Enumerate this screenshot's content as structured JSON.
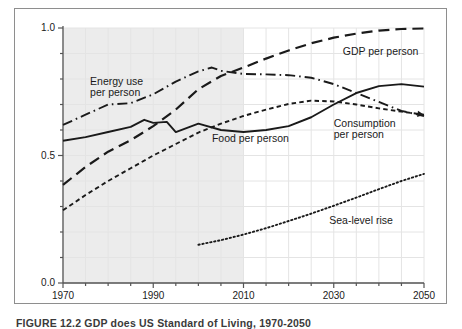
{
  "figure": {
    "caption": "FIGURE 12.2   GDP does US Standard of Living, 1970-2050",
    "frame_color": "#8e8e8e",
    "background": "#ffffff",
    "shade_color": "#ececec",
    "grid_color": "#e4e4e4",
    "axis_color": "#555555",
    "line_color": "#1a1a1a"
  },
  "chart_data": {
    "type": "line",
    "title": "",
    "xlabel": "",
    "ylabel": "",
    "xlim": [
      1970,
      2050
    ],
    "ylim": [
      0.0,
      1.0
    ],
    "grid": true,
    "legend": "annotated-inline",
    "x_ticks": [
      1970,
      1990,
      2010,
      2030,
      2050
    ],
    "x_tick_labels": [
      "1970",
      "1990",
      "2010",
      "2030",
      "2050"
    ],
    "x_minor_step": 5,
    "y_ticks": [
      0.0,
      0.5,
      1.0
    ],
    "y_tick_labels": [
      "0.0",
      "0.5",
      "1.0"
    ],
    "y_minor_step": 0.1,
    "shaded_region": {
      "from": 1970,
      "to": 2010,
      "note": "historical period shading"
    },
    "series": [
      {
        "name": "GDP per person",
        "style": "long-dash",
        "label_x": 2032,
        "label_y": 0.905,
        "x": [
          1970,
          1975,
          1980,
          1985,
          1990,
          1995,
          2000,
          2005,
          2010,
          2015,
          2020,
          2025,
          2030,
          2035,
          2040,
          2045,
          2050
        ],
        "y": [
          0.385,
          0.455,
          0.515,
          0.56,
          0.615,
          0.68,
          0.76,
          0.812,
          0.845,
          0.88,
          0.912,
          0.94,
          0.962,
          0.978,
          0.99,
          0.996,
          0.998
        ]
      },
      {
        "name": "Energy use per person",
        "style": "dash-dot",
        "label_x": 1976,
        "label_y": 0.79,
        "label_lines": [
          "Energy use",
          "per person"
        ],
        "x": [
          1970,
          1975,
          1980,
          1985,
          1990,
          1995,
          2000,
          2003,
          2005,
          2010,
          2015,
          2020,
          2025,
          2030,
          2035,
          2040,
          2045,
          2050
        ],
        "y": [
          0.62,
          0.66,
          0.7,
          0.705,
          0.74,
          0.79,
          0.83,
          0.845,
          0.832,
          0.82,
          0.818,
          0.815,
          0.805,
          0.78,
          0.745,
          0.71,
          0.675,
          0.655
        ]
      },
      {
        "name": "Consumption per person",
        "style": "short-dash",
        "label_x": 2030,
        "label_y": 0.625,
        "label_lines": [
          "Consumption",
          "per person"
        ],
        "x": [
          1970,
          1975,
          1980,
          1985,
          1990,
          1995,
          2000,
          2005,
          2010,
          2015,
          2020,
          2025,
          2030,
          2035,
          2040,
          2045,
          2050
        ],
        "y": [
          0.285,
          0.345,
          0.4,
          0.45,
          0.5,
          0.545,
          0.59,
          0.625,
          0.655,
          0.68,
          0.702,
          0.715,
          0.712,
          0.7,
          0.685,
          0.672,
          0.66
        ]
      },
      {
        "name": "Food per person",
        "style": "solid",
        "label_x": 2003,
        "label_y": 0.565,
        "x": [
          1970,
          1975,
          1980,
          1985,
          1988,
          1990,
          1993,
          1995,
          2000,
          2005,
          2010,
          2015,
          2020,
          2025,
          2030,
          2035,
          2040,
          2045,
          2050
        ],
        "y": [
          0.558,
          0.572,
          0.592,
          0.612,
          0.64,
          0.628,
          0.632,
          0.592,
          0.625,
          0.6,
          0.592,
          0.6,
          0.615,
          0.65,
          0.7,
          0.745,
          0.772,
          0.78,
          0.77
        ]
      },
      {
        "name": "Sea-level rise",
        "style": "dotted",
        "label_x": 2029,
        "label_y": 0.245,
        "x": [
          2000,
          2005,
          2010,
          2015,
          2020,
          2025,
          2030,
          2035,
          2040,
          2045,
          2050
        ],
        "y": [
          0.15,
          0.168,
          0.19,
          0.215,
          0.243,
          0.272,
          0.303,
          0.335,
          0.368,
          0.4,
          0.428
        ]
      }
    ]
  }
}
